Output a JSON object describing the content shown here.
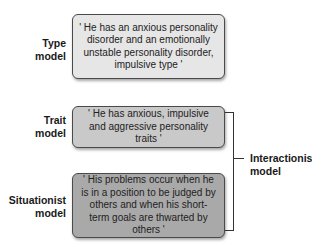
{
  "diagram": {
    "models": [
      {
        "name": "Type\nmodel",
        "quote": "' He has an anxious personality disorder and an emotionally unstable personality disorder, impulsive type '",
        "fill": "#e6e6e6"
      },
      {
        "name": "Trait\nmodel",
        "quote": "' He has anxious, impulsive and aggressive personality traits '",
        "fill": "#c9c9c9"
      },
      {
        "name": "Situationist\nmodel",
        "quote": "' His problems occur when he is in a position to be judged by others and when his short-term goals are thwarted by others '",
        "fill": "#a9a9a9"
      }
    ],
    "bracket_label": "Interactionist\nmodel",
    "colors": {
      "border": "#4a4a4a",
      "connector": "#333333",
      "background": "#ffffff"
    }
  }
}
